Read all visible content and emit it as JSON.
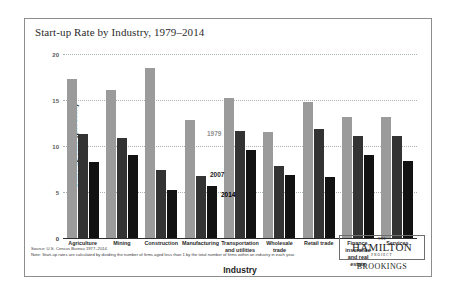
{
  "figure": {
    "title": "Start-up Rate by Industry, 1979–2014",
    "source_line": "Source: U.S. Census Bureau 1977–2014.",
    "note_line": "Note: Start-up rates are calculated by dividing the number of firms aged less than 1 by the total number of firms within an industry in each year.",
    "border_color": "#8d8d8d"
  },
  "logo": {
    "the": "THE",
    "hamilton": "HAMILTON",
    "project": "PROJECT",
    "brookings": "BROOKINGS"
  },
  "annotations": {
    "label_1979": "1979",
    "label_2007": "2007",
    "label_2014": "2014"
  },
  "chart_data": {
    "type": "bar",
    "title": "Start-up Rate by Industry, 1979–2014",
    "xlabel": "Industry",
    "ylabel": "Start-up rate (percent)",
    "ylim": [
      0,
      20
    ],
    "yticks": [
      0,
      5,
      10,
      15,
      20
    ],
    "ytick_labels": [
      "0",
      "5",
      "10",
      "15",
      "20"
    ],
    "grid": true,
    "legend": "inline-annotations",
    "categories": [
      "Agriculture",
      "Mining",
      "Construction",
      "Manufacturing",
      "Transportation and utilities",
      "Wholesale trade",
      "Retail trade",
      "Finance, insurance and real estate",
      "Services"
    ],
    "category_lines": [
      [
        "Agriculture"
      ],
      [
        "Mining"
      ],
      [
        "Construction"
      ],
      [
        "Manufacturing"
      ],
      [
        "Transportation",
        "and utilities"
      ],
      [
        "Wholesale",
        "trade"
      ],
      [
        "Retail trade"
      ],
      [
        "Finance,",
        "insurance",
        "and real estate"
      ],
      [
        "Services"
      ]
    ],
    "series": [
      {
        "name": "1979",
        "color": "#9b9b9b",
        "values": [
          17.3,
          16.1,
          18.5,
          12.8,
          15.2,
          11.5,
          14.8,
          13.2,
          13.2
        ]
      },
      {
        "name": "2007",
        "color": "#333333",
        "values": [
          11.3,
          10.9,
          7.4,
          6.7,
          11.6,
          7.8,
          11.9,
          11.1,
          11.1
        ]
      },
      {
        "name": "2014",
        "color": "#121212",
        "values": [
          8.3,
          9.0,
          5.2,
          5.6,
          9.6,
          6.9,
          6.6,
          9.0,
          8.4
        ]
      }
    ]
  }
}
